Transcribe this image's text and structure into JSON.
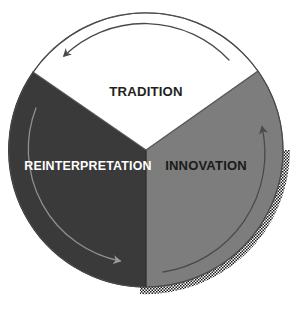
{
  "diagram": {
    "type": "cycle-diagram",
    "title_visible": false,
    "shape": "circle divided into three sectors",
    "background_color": "#ffffff",
    "sectors": [
      {
        "id": "tradition",
        "label": "TRADITION",
        "fill_color": "#ffffff",
        "text_color": "#231f20",
        "position": "top",
        "outline_color": "#4d4d4d"
      },
      {
        "id": "reinterpretation",
        "label": "REINTERPRETATION",
        "fill_color": "#3a3a3a",
        "text_color": "#ffffff",
        "position": "left",
        "outline_color": "#2b2b2b"
      },
      {
        "id": "innovation",
        "label": "INNOVATION",
        "fill_color": "#7d7d7d",
        "text_color": "#1a1a1a",
        "position": "right",
        "outline_color": "#5a5a5a"
      }
    ],
    "arrows": [
      {
        "id": "arrow-top",
        "in_sector": "tradition",
        "direction": "counterclockwise",
        "points_to": "left",
        "color": "#4a4a4a"
      },
      {
        "id": "arrow-left",
        "in_sector": "reinterpretation",
        "direction": "clockwise-downward",
        "points_to": "bottom-right",
        "color": "#8a8a8a"
      },
      {
        "id": "arrow-right",
        "in_sector": "innovation",
        "direction": "counterclockwise-upward",
        "points_to": "top",
        "color": "#4a4a4a"
      }
    ],
    "shadow": {
      "id": "halftone-shadow",
      "style": "halftone-dotted-arc",
      "position": "lower-right outer edge",
      "color": "#1a1a1a"
    }
  }
}
